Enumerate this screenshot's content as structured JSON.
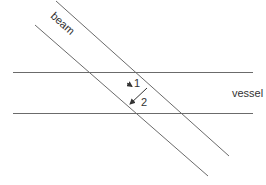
{
  "diagram": {
    "labels": {
      "beam": "beam",
      "vessel": "vessel",
      "angle_1": "1",
      "angle_2": "2"
    },
    "colors": {
      "line": "#6b6b6b",
      "text": "#333333",
      "background": "#ffffff"
    }
  }
}
